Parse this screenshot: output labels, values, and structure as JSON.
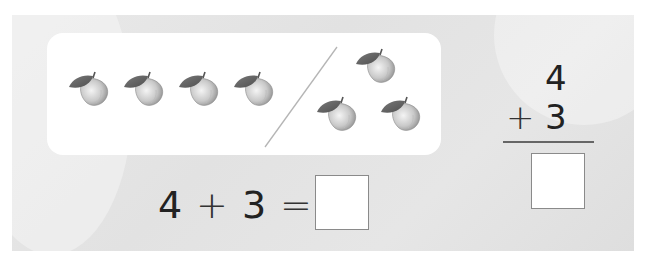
{
  "picture": {
    "left_group": {
      "count": 4,
      "icon": "apple-icon"
    },
    "right_group": {
      "count": 3,
      "icon": "apple-icon"
    },
    "separator": "slash-divider"
  },
  "horizontal_equation": {
    "addend1": "4",
    "operator": "+",
    "addend2": "3",
    "equals": "=",
    "answer": ""
  },
  "vertical_equation": {
    "addend1": "4",
    "operator": "+",
    "addend2": "3",
    "answer": ""
  },
  "colors": {
    "panel_background": "#e4e4e4",
    "card_background": "#ffffff",
    "text": "#222222",
    "box_border": "#8a8a8a"
  }
}
